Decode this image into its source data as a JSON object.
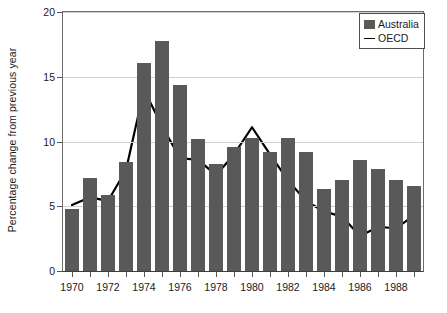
{
  "chart_data": {
    "type": "bar",
    "title": "",
    "xlabel": "",
    "ylabel": "Percentage change from previous year",
    "ylim": [
      0,
      20
    ],
    "yticks": [
      0,
      5,
      10,
      15,
      20
    ],
    "ytick_labels": [
      "0",
      "5",
      "10",
      "15",
      "20"
    ],
    "xlim": [
      1970,
      1989
    ],
    "grid": true,
    "grid_axis": "y",
    "legend_position": "top-right",
    "categories": [
      "1970",
      "1971",
      "1972",
      "1973",
      "1974",
      "1975",
      "1976",
      "1977",
      "1978",
      "1979",
      "1980",
      "1981",
      "1982",
      "1983",
      "1984",
      "1985",
      "1986",
      "1987",
      "1988",
      "1989"
    ],
    "xtick_labels": [
      "1970",
      "1972",
      "1974",
      "1976",
      "1978",
      "1980",
      "1982",
      "1984",
      "1986",
      "1988"
    ],
    "series": [
      {
        "name": "Australia",
        "type": "bar",
        "color": "#595959",
        "values": [
          4.8,
          7.2,
          5.9,
          8.4,
          16.1,
          17.8,
          14.4,
          10.2,
          8.3,
          9.6,
          10.3,
          9.2,
          10.3,
          9.2,
          6.3,
          7.0,
          8.6,
          7.9,
          7.0,
          6.6
        ]
      },
      {
        "name": "OECD",
        "type": "line",
        "color": "#000000",
        "values": [
          5.1,
          5.7,
          5.4,
          7.8,
          14.0,
          11.2,
          8.7,
          8.6,
          7.4,
          9.0,
          11.1,
          9.0,
          7.0,
          5.4,
          4.6,
          4.2,
          2.7,
          3.4,
          3.3,
          4.3
        ]
      }
    ]
  },
  "legend": {
    "items": [
      {
        "label": "Australia",
        "marker": "square-swatch"
      },
      {
        "label": "OECD",
        "marker": "line-swatch"
      }
    ]
  }
}
